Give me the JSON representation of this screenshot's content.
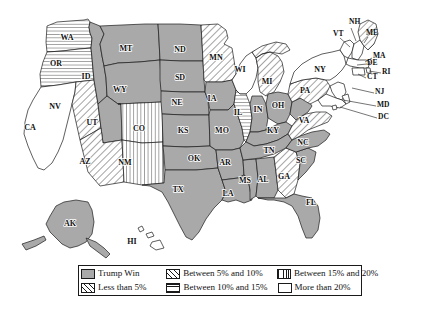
{
  "figure": {
    "type": "choropleth-map",
    "region": "United States",
    "background_color": "#ffffff",
    "outline_color": "#1a1a1a",
    "fill_gray": "#a9a9a9"
  },
  "legend": {
    "border_color": "#1a1a1a",
    "items": [
      {
        "label": "Trump Win",
        "pattern": "solid-gray",
        "swatch_class": "sw-solid"
      },
      {
        "label": "Between 5% and 10%",
        "pattern": "diagonal-lines",
        "swatch_class": "sw-diag"
      },
      {
        "label": "Between 15% and 20%",
        "pattern": "vertical-lines",
        "swatch_class": "sw-vert"
      },
      {
        "label": "Less than 5%",
        "pattern": "diagonal-lines",
        "swatch_class": "sw-diag"
      },
      {
        "label": "Between 10% and 15%",
        "pattern": "horizontal-lines",
        "swatch_class": "sw-horiz"
      },
      {
        "label": "More than 20%",
        "pattern": "white",
        "swatch_class": "sw-white"
      }
    ]
  },
  "chart_data": {
    "type": "heatmap",
    "title": "",
    "xlabel": "",
    "ylabel": "",
    "legend_position": "bottom",
    "categories": [
      "Trump Win",
      "Less than 5%",
      "Between 5% and 10%",
      "Between 10% and 15%",
      "Between 15% and 20%",
      "More than 20%"
    ],
    "states": [
      {
        "code": "WA",
        "category": "Between 10% and 15%"
      },
      {
        "code": "OR",
        "category": "Between 10% and 15%"
      },
      {
        "code": "CA",
        "category": "More than 20%"
      },
      {
        "code": "NV",
        "category": "Less than 5%"
      },
      {
        "code": "ID",
        "category": "Trump Win"
      },
      {
        "code": "MT",
        "category": "Trump Win"
      },
      {
        "code": "WY",
        "category": "Trump Win"
      },
      {
        "code": "UT",
        "category": "Trump Win"
      },
      {
        "code": "AZ",
        "category": "Less than 5%"
      },
      {
        "code": "CO",
        "category": "Between 15% and 20%"
      },
      {
        "code": "NM",
        "category": "Between 15% and 20%"
      },
      {
        "code": "ND",
        "category": "Trump Win"
      },
      {
        "code": "SD",
        "category": "Trump Win"
      },
      {
        "code": "NE",
        "category": "Trump Win"
      },
      {
        "code": "KS",
        "category": "Trump Win"
      },
      {
        "code": "OK",
        "category": "Trump Win"
      },
      {
        "code": "TX",
        "category": "Trump Win"
      },
      {
        "code": "MN",
        "category": "Less than 5%"
      },
      {
        "code": "IA",
        "category": "Trump Win"
      },
      {
        "code": "MO",
        "category": "Trump Win"
      },
      {
        "code": "AR",
        "category": "Trump Win"
      },
      {
        "code": "LA",
        "category": "Trump Win"
      },
      {
        "code": "WI",
        "category": "More than 20%"
      },
      {
        "code": "IL",
        "category": "Between 10% and 15%"
      },
      {
        "code": "MS",
        "category": "Trump Win"
      },
      {
        "code": "MI",
        "category": "Less than 5%"
      },
      {
        "code": "IN",
        "category": "Trump Win"
      },
      {
        "code": "KY",
        "category": "Trump Win"
      },
      {
        "code": "TN",
        "category": "Trump Win"
      },
      {
        "code": "AL",
        "category": "Trump Win"
      },
      {
        "code": "OH",
        "category": "Trump Win"
      },
      {
        "code": "GA",
        "category": "Less than 5%"
      },
      {
        "code": "FL",
        "category": "Trump Win"
      },
      {
        "code": "SC",
        "category": "Trump Win"
      },
      {
        "code": "NC",
        "category": "Trump Win"
      },
      {
        "code": "VA",
        "category": "Less than 5%"
      },
      {
        "code": "WV",
        "category": "Trump Win"
      },
      {
        "code": "PA",
        "category": "Less than 5%"
      },
      {
        "code": "NY",
        "category": "More than 20%"
      },
      {
        "code": "VT",
        "category": "More than 20%"
      },
      {
        "code": "NH",
        "category": "More than 20%"
      },
      {
        "code": "ME",
        "category": "Less than 5%"
      },
      {
        "code": "MA",
        "category": "More than 20%"
      },
      {
        "code": "RI",
        "category": "More than 20%"
      },
      {
        "code": "CT",
        "category": "More than 20%"
      },
      {
        "code": "NJ",
        "category": "More than 20%"
      },
      {
        "code": "DE",
        "category": "More than 20%"
      },
      {
        "code": "MD",
        "category": "More than 20%"
      },
      {
        "code": "DC",
        "category": "More than 20%"
      },
      {
        "code": "AK",
        "category": "Trump Win"
      },
      {
        "code": "HI",
        "category": "More than 20%"
      }
    ]
  },
  "map": {
    "inside_labels": [
      {
        "code": "WA",
        "x": 67,
        "y": 38
      },
      {
        "code": "OR",
        "x": 56,
        "y": 64
      },
      {
        "code": "CA",
        "x": 30,
        "y": 128
      },
      {
        "code": "NV",
        "x": 55,
        "y": 107
      },
      {
        "code": "ID",
        "x": 86,
        "y": 77
      },
      {
        "code": "MT",
        "x": 126,
        "y": 49
      },
      {
        "code": "WY",
        "x": 120,
        "y": 90
      },
      {
        "code": "UT",
        "x": 92,
        "y": 123
      },
      {
        "code": "AZ",
        "x": 85,
        "y": 162
      },
      {
        "code": "CO",
        "x": 139,
        "y": 129
      },
      {
        "code": "NM",
        "x": 125,
        "y": 163
      },
      {
        "code": "ND",
        "x": 180,
        "y": 50
      },
      {
        "code": "SD",
        "x": 180,
        "y": 78
      },
      {
        "code": "NE",
        "x": 177,
        "y": 103
      },
      {
        "code": "KS",
        "x": 183,
        "y": 131
      },
      {
        "code": "OK",
        "x": 194,
        "y": 159
      },
      {
        "code": "TX",
        "x": 178,
        "y": 190
      },
      {
        "code": "MN",
        "x": 216,
        "y": 58
      },
      {
        "code": "IA",
        "x": 212,
        "y": 99
      },
      {
        "code": "MO",
        "x": 222,
        "y": 131
      },
      {
        "code": "AR",
        "x": 225,
        "y": 163
      },
      {
        "code": "LA",
        "x": 228,
        "y": 194
      },
      {
        "code": "WI",
        "x": 240,
        "y": 70
      },
      {
        "code": "IL",
        "x": 238,
        "y": 113
      },
      {
        "code": "MS",
        "x": 245,
        "y": 181
      },
      {
        "code": "MI",
        "x": 267,
        "y": 82
      },
      {
        "code": "IN",
        "x": 258,
        "y": 110
      },
      {
        "code": "KY",
        "x": 273,
        "y": 131
      },
      {
        "code": "TN",
        "x": 269,
        "y": 151
      },
      {
        "code": "AL",
        "x": 263,
        "y": 180
      },
      {
        "code": "OH",
        "x": 278,
        "y": 106
      },
      {
        "code": "GA",
        "x": 284,
        "y": 177
      },
      {
        "code": "FL",
        "x": 311,
        "y": 203
      },
      {
        "code": "SC",
        "x": 301,
        "y": 161
      },
      {
        "code": "NC",
        "x": 303,
        "y": 143
      },
      {
        "code": "VA",
        "x": 304,
        "y": 121
      },
      {
        "code": "PA",
        "x": 305,
        "y": 91
      },
      {
        "code": "NY",
        "x": 320,
        "y": 70
      },
      {
        "code": "AK",
        "x": 70,
        "y": 224
      },
      {
        "code": "HI",
        "x": 132,
        "y": 242
      }
    ],
    "outside_labels": [
      {
        "code": "NH",
        "tx": 349,
        "ty": 22,
        "lx": 351,
        "ly": 28,
        "ex": 356,
        "ey": 41
      },
      {
        "code": "VT",
        "tx": 333,
        "ty": 34,
        "lx": 340,
        "ly": 38,
        "ex": 350,
        "ey": 47
      },
      {
        "code": "ME",
        "tx": 366,
        "ty": 33,
        "lx": 368,
        "ly": 37,
        "ex": 364,
        "ey": 43
      },
      {
        "code": "MA",
        "tx": 373,
        "ty": 56,
        "lx": 372,
        "ly": 58,
        "ex": 365,
        "ey": 62
      },
      {
        "code": "RI",
        "tx": 382,
        "ty": 72,
        "lx": 381,
        "ly": 73,
        "ex": 369,
        "ey": 71
      },
      {
        "code": "CT",
        "tx": 367,
        "ty": 77,
        "lx": 366,
        "ly": 78,
        "ex": 358,
        "ey": 74
      },
      {
        "code": "NJ",
        "tx": 375,
        "ty": 92,
        "lx": 374,
        "ly": 93,
        "ex": 352,
        "ey": 88
      },
      {
        "code": "MD",
        "tx": 377,
        "ty": 105,
        "lx": 376,
        "ly": 106,
        "ex": 343,
        "ey": 100
      },
      {
        "code": "DC",
        "tx": 378,
        "ty": 117,
        "lx": 377,
        "ly": 118,
        "ex": 340,
        "ey": 107
      },
      {
        "code": "DE",
        "tx": 367,
        "ty": 63,
        "lx": 367,
        "ly": 64,
        "ex": 357,
        "ey": 65
      }
    ]
  }
}
